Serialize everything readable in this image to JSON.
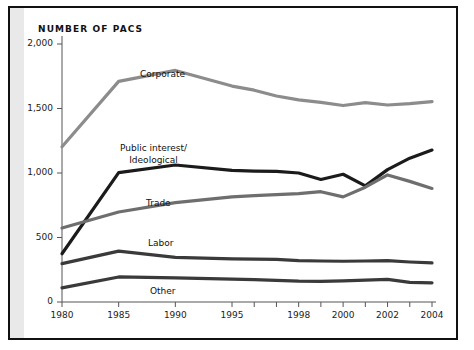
{
  "figure": {
    "title": "NUMBER OF PACS",
    "frame_color": "#111111",
    "gutter_color": "#e9e9e9",
    "background": "#ffffff"
  },
  "chart_data": {
    "type": "line",
    "title": "NUMBER OF PACS",
    "xlabel": "",
    "ylabel": "",
    "grid": false,
    "legend": "inline-labels",
    "xlim": [
      1980,
      2004
    ],
    "ylim": [
      0,
      2000
    ],
    "yticks": [
      0,
      500,
      1000,
      1500,
      2000
    ],
    "ytick_labels": [
      "0",
      "500",
      "1,000",
      "1,500",
      "2,000"
    ],
    "xticks": [
      1980,
      1985,
      1990,
      1995,
      1996,
      1997,
      1998,
      1999,
      2000,
      2001,
      2002,
      2003,
      2004
    ],
    "xtick_labels_shown": [
      "1980",
      "1985",
      "1990",
      "1995",
      "1998",
      "2000",
      "2002",
      "2004"
    ],
    "x": [
      1980,
      1985,
      1990,
      1995,
      1996,
      1997,
      1998,
      1999,
      2000,
      2001,
      2002,
      2003,
      2004
    ],
    "series": [
      {
        "name": "Corporate",
        "color": "#8c8c8c",
        "values": [
          1204,
          1710,
          1795,
          1674,
          1642,
          1597,
          1567,
          1548,
          1523,
          1545,
          1527,
          1538,
          1553
        ]
      },
      {
        "name": "Public interest/Ideological",
        "label_line1": "Public interest/",
        "label_line2": "Ideological",
        "color": "#1b1b1b",
        "values": [
          374,
          1003,
          1062,
          1020,
          1015,
          1013,
          1000,
          950,
          990,
          900,
          1026,
          1115,
          1178
        ]
      },
      {
        "name": "Trade",
        "color": "#6e6e6e",
        "values": [
          574,
          698,
          770,
          815,
          825,
          833,
          840,
          855,
          815,
          890,
          985,
          935,
          880
        ]
      },
      {
        "name": "Labor",
        "color": "#3a3a3a",
        "values": [
          297,
          394,
          346,
          334,
          332,
          330,
          321,
          318,
          316,
          318,
          320,
          310,
          303
        ]
      },
      {
        "name": "Other",
        "color": "#3a3a3a",
        "values": [
          110,
          194,
          187,
          177,
          173,
          168,
          162,
          160,
          164,
          170,
          175,
          152,
          149
        ]
      }
    ]
  }
}
